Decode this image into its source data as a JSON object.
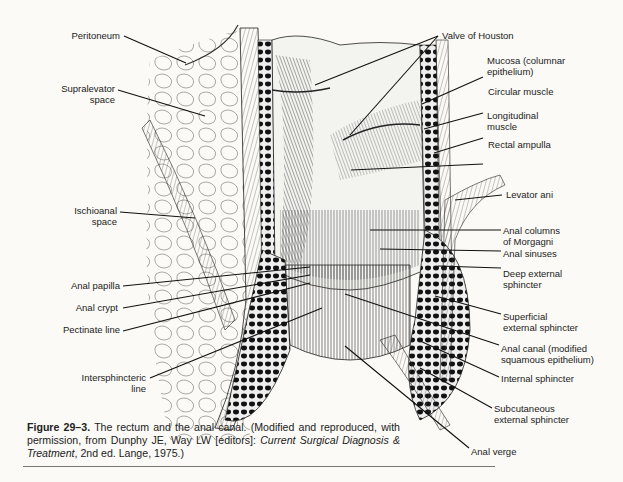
{
  "figure": {
    "number_label": "Figure 29–3.",
    "caption_text": " The rectum and the anal canal. (Modified and reproduced, with permission, from Dunphy JE, Way LW [editors]: ",
    "caption_italic_1": "Current Surgical Diagnosis & Treatment",
    "caption_tail": ", 2nd ed. Lange, 1975.)",
    "title": "The rectum and the anal canal"
  },
  "labels_left": [
    {
      "id": "peritoneum",
      "lines": [
        "Peritoneum"
      ]
    },
    {
      "id": "supralevator-space",
      "lines": [
        "Supralevator",
        "space"
      ]
    },
    {
      "id": "ischioanal-space",
      "lines": [
        "Ischioanal",
        "space"
      ]
    },
    {
      "id": "anal-papilla",
      "lines": [
        "Anal papilla"
      ]
    },
    {
      "id": "anal-crypt",
      "lines": [
        "Anal crypt"
      ]
    },
    {
      "id": "pectinate-line",
      "lines": [
        "Pectinate line"
      ]
    },
    {
      "id": "intersphincteric-line",
      "lines": [
        "Intersphincteric",
        "line"
      ]
    }
  ],
  "labels_right": [
    {
      "id": "valve-of-houston",
      "lines": [
        "Valve of Houston"
      ]
    },
    {
      "id": "mucosa",
      "lines": [
        "Mucosa (columnar",
        "epithelium)"
      ]
    },
    {
      "id": "circular-muscle",
      "lines": [
        "Circular muscle"
      ]
    },
    {
      "id": "longitudinal-muscle",
      "lines": [
        "Longitudinal",
        "muscle"
      ]
    },
    {
      "id": "rectal-ampulla",
      "lines": [
        "Rectal ampulla"
      ]
    },
    {
      "id": "levator-ani",
      "lines": [
        "Levator ani"
      ]
    },
    {
      "id": "anal-columns",
      "lines": [
        "Anal columns",
        "of Morgagni"
      ]
    },
    {
      "id": "anal-sinuses",
      "lines": [
        "Anal sinuses"
      ]
    },
    {
      "id": "deep-external-sphincter",
      "lines": [
        "Deep external",
        "sphincter"
      ]
    },
    {
      "id": "superficial-external-sphincter",
      "lines": [
        "Superficial",
        "external sphincter"
      ]
    },
    {
      "id": "anal-canal",
      "lines": [
        "Anal canal (modified",
        "squamous epithelium)"
      ]
    },
    {
      "id": "internal-sphincter",
      "lines": [
        "Internal sphincter"
      ]
    },
    {
      "id": "subcutaneous-external-sphincter",
      "lines": [
        "Subcutaneous",
        "external sphincter"
      ]
    },
    {
      "id": "anal-verge",
      "lines": [
        "Anal verge"
      ]
    }
  ],
  "colors": {
    "background": "#fbfaf6",
    "ink": "#1a1a1a",
    "rule": "#777777"
  }
}
